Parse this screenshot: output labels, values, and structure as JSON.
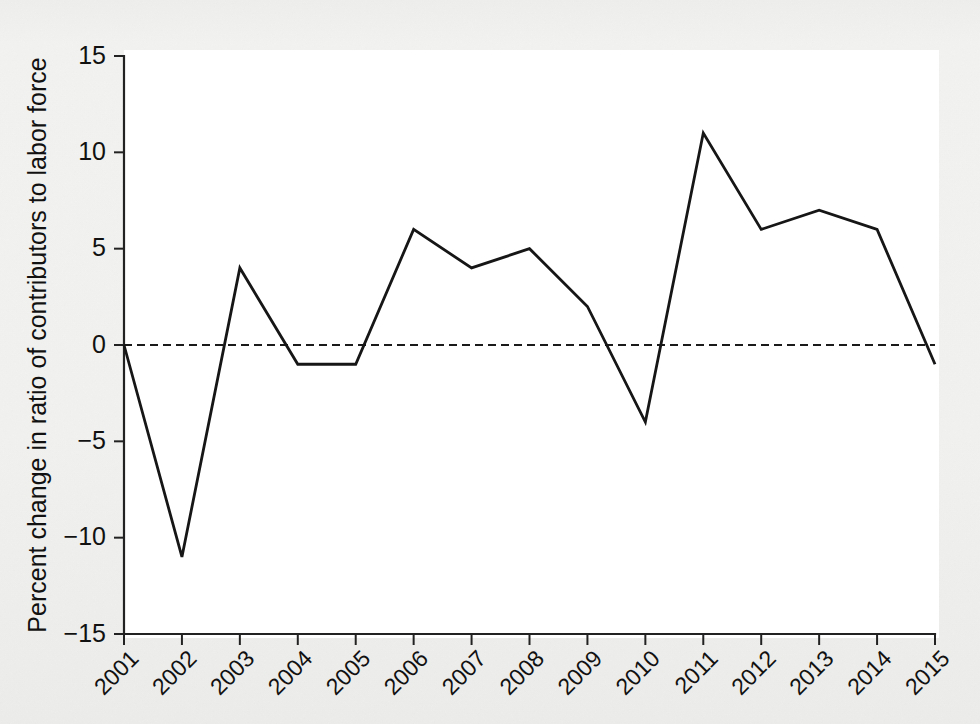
{
  "figure": {
    "background_color": "#f1f1ef",
    "plot_background_color": "#ffffff",
    "line_color": "#161616",
    "axis_color": "#222222"
  },
  "axes": {
    "ylabel": "Percent change in ratio of contributors to labor force",
    "xlabel": "",
    "ytick_labels": [
      "15",
      "10",
      "5",
      "0",
      "−5",
      "−10",
      "−15"
    ],
    "xtick_labels": [
      "2001",
      "2002",
      "2003",
      "2004",
      "2005",
      "2006",
      "2007",
      "2008",
      "2009",
      "2010",
      "2011",
      "2012",
      "2013",
      "2014",
      "2015"
    ],
    "xtick_rotation_degrees": 45
  },
  "reference_line": {
    "value": 0,
    "style": "dashed"
  },
  "chart_data": {
    "type": "line",
    "title": "",
    "subtitle": "",
    "xlabel": "",
    "ylabel": "Percent change in ratio of contributors to labor force",
    "x": [
      2001,
      2002,
      2003,
      2004,
      2005,
      2006,
      2007,
      2008,
      2009,
      2010,
      2011,
      2012,
      2013,
      2014,
      2015
    ],
    "categories": [
      "2001",
      "2002",
      "2003",
      "2004",
      "2005",
      "2006",
      "2007",
      "2008",
      "2009",
      "2010",
      "2011",
      "2012",
      "2013",
      "2014",
      "2015"
    ],
    "values": [
      0,
      -11,
      4,
      -1,
      -1,
      6,
      4,
      5,
      2,
      -4,
      11,
      6,
      7,
      6,
      -1
    ],
    "series": [
      {
        "name": "Percent change in ratio of contributors to labor force",
        "values": [
          0,
          -11,
          4,
          -1,
          -1,
          6,
          4,
          5,
          2,
          -4,
          11,
          6,
          7,
          6,
          -1
        ]
      }
    ],
    "ylim": [
      -15,
      15
    ],
    "yticks": [
      15,
      10,
      5,
      0,
      -5,
      -10,
      -15
    ],
    "xlim": [
      2001,
      2015
    ],
    "grid": false,
    "legend": null,
    "annotations": [
      {
        "type": "hline",
        "y": 0,
        "style": "dashed"
      }
    ]
  }
}
